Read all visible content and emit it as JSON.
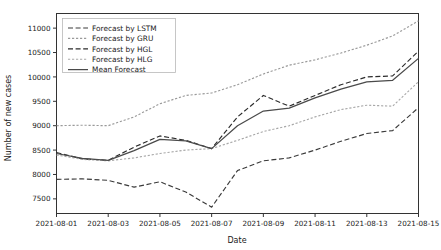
{
  "chart_data": {
    "type": "line",
    "title": "",
    "xlabel": "Date",
    "ylabel": "Number of new cases",
    "grid": false,
    "legend_position": "upper left",
    "x": [
      "2021-08-01",
      "2021-08-02",
      "2021-08-03",
      "2021-08-04",
      "2021-08-05",
      "2021-08-06",
      "2021-08-07",
      "2021-08-08",
      "2021-08-09",
      "2021-08-10",
      "2021-08-11",
      "2021-08-12",
      "2021-08-13",
      "2021-08-14",
      "2021-08-15"
    ],
    "xtick_labels": [
      "2021-08-01",
      "2021-08-03",
      "2021-08-05",
      "2021-08-07",
      "2021-08-09",
      "2021-08-11",
      "2021-08-13",
      "2021-08-15"
    ],
    "xtick_values": [
      "2021-08-01",
      "2021-08-03",
      "2021-08-05",
      "2021-08-07",
      "2021-08-09",
      "2021-08-11",
      "2021-08-13",
      "2021-08-15"
    ],
    "ytick_labels": [
      "7500",
      "8000",
      "8500",
      "9000",
      "9500",
      "10000",
      "10500",
      "11000"
    ],
    "ylim": [
      7200,
      11300
    ],
    "series": [
      {
        "name": "Forecast by LSTM",
        "style": "dashed",
        "color": "#3a3a3a",
        "values": [
          7900,
          7910,
          7880,
          7740,
          7850,
          7640,
          7330,
          8080,
          8280,
          8340,
          8500,
          8680,
          8840,
          8900,
          9370
        ]
      },
      {
        "name": "Forecast by GRU",
        "style": "dotted",
        "color": "#9a9a9a",
        "values": [
          9000,
          9010,
          9000,
          9180,
          9450,
          9620,
          9670,
          9840,
          10060,
          10240,
          10350,
          10490,
          10650,
          10840,
          11150
        ]
      },
      {
        "name": "Forecast by HGL",
        "style": "dashed",
        "color": "#2b2b2b",
        "values": [
          8450,
          8320,
          8290,
          8560,
          8790,
          8700,
          8530,
          9180,
          9620,
          9400,
          9620,
          9840,
          10000,
          10020,
          10530
        ]
      },
      {
        "name": "Forecast by HLG",
        "style": "dotted",
        "color": "#a8a8a8",
        "values": [
          8400,
          8310,
          8280,
          8340,
          8430,
          8500,
          8530,
          8700,
          8880,
          9000,
          9180,
          9330,
          9420,
          9400,
          9900
        ]
      },
      {
        "name": "Mean Forecast",
        "style": "solid",
        "color": "#4a4a4a",
        "values": [
          8430,
          8330,
          8290,
          8490,
          8720,
          8690,
          8530,
          9000,
          9300,
          9360,
          9570,
          9750,
          9900,
          9930,
          10380
        ]
      }
    ]
  },
  "legend": {
    "entries": [
      {
        "label": "Forecast by LSTM"
      },
      {
        "label": "Forecast by GRU"
      },
      {
        "label": "Forecast by HGL"
      },
      {
        "label": "Forecast by HLG"
      },
      {
        "label": "Mean Forecast"
      }
    ]
  }
}
